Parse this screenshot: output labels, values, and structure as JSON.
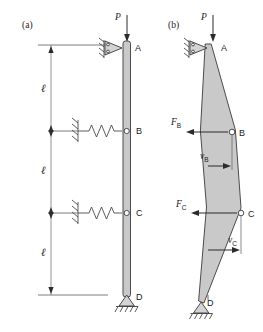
{
  "figure": {
    "panels": [
      {
        "id": "a",
        "label": "(a)",
        "caption_x": 22,
        "caption_y": 28
      },
      {
        "id": "b",
        "label": "(b)",
        "caption_x": 168,
        "caption_y": 28
      }
    ],
    "load_label": "P",
    "length_label": "ℓ",
    "lengths": [
      {
        "label": "ℓ",
        "x": 41,
        "y": 92
      },
      {
        "label": "ℓ",
        "x": 41,
        "y": 174
      },
      {
        "label": "ℓ",
        "x": 41,
        "y": 256
      }
    ],
    "nodes_a": [
      {
        "name": "A",
        "label": "A",
        "x": 135,
        "y": 48
      },
      {
        "name": "B",
        "label": "B",
        "x": 136,
        "y": 133
      },
      {
        "name": "C",
        "label": "C",
        "x": 136,
        "y": 215
      },
      {
        "name": "D",
        "label": "D",
        "x": 136,
        "y": 300
      }
    ],
    "nodes_b": [
      {
        "name": "A",
        "label": "A",
        "x": 221,
        "y": 48
      },
      {
        "name": "B",
        "label": "B",
        "x": 239,
        "y": 135
      },
      {
        "name": "C",
        "label": "C",
        "x": 248,
        "y": 217
      },
      {
        "name": "D",
        "label": "D",
        "x": 207,
        "y": 304
      }
    ],
    "load_a": {
      "label": "P",
      "x": 120,
      "y": 16
    },
    "load_b": {
      "label": "P",
      "x": 206,
      "y": 16
    },
    "forces": [
      {
        "name": "F_B",
        "base": "F",
        "sub": "B",
        "x": 173,
        "y": 122,
        "direction": "left"
      },
      {
        "name": "F_C",
        "base": "F",
        "sub": "C",
        "x": 178,
        "y": 206,
        "direction": "left"
      }
    ],
    "displacements": [
      {
        "name": "v_B",
        "base": "v",
        "sub": "B",
        "x": 203,
        "y": 152,
        "direction": "right"
      },
      {
        "name": "v_C",
        "base": "v",
        "sub": "C",
        "x": 232,
        "y": 240,
        "direction": "right"
      }
    ],
    "springs": [
      {
        "at_node": "B",
        "y": 131
      },
      {
        "at_node": "C",
        "y": 213
      }
    ],
    "supports": {
      "top_a": "roller-pin-horizontal",
      "top_b": "roller-pin-horizontal",
      "base_a": "pinned-triangle-ground",
      "base_b": "pinned-triangle-ground"
    },
    "colors": {
      "member_fill": "#c9c9c9",
      "member_stroke": "#3a3a3a",
      "dimension": "#7a7a7a",
      "arrow": "#2b2b2b",
      "dashed_reference": "#555555",
      "background": "#ffffff"
    }
  }
}
